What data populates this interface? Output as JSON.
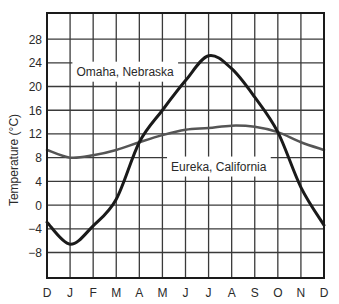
{
  "chart_data": {
    "type": "line",
    "title": "",
    "xlabel": "",
    "ylabel": "Temperature (°C)",
    "categories": [
      "D",
      "J",
      "F",
      "M",
      "A",
      "M",
      "J",
      "J",
      "A",
      "S",
      "O",
      "N",
      "D"
    ],
    "yticks": [
      -8,
      -4,
      0,
      4,
      8,
      12,
      16,
      20,
      24,
      28
    ],
    "ylim": [
      -12.3,
      32.4
    ],
    "grid": true,
    "legend": "inline labels",
    "series": [
      {
        "name": "Omaha, Nebraska",
        "color": "#1a1a1a",
        "stroke_width": 3,
        "values": [
          -2.9,
          -6.6,
          -3.5,
          1.0,
          10.6,
          16.0,
          21.0,
          25.2,
          23.0,
          18.2,
          12.3,
          3.0,
          -3.4
        ]
      },
      {
        "name": "Eureka, California",
        "color": "#555555",
        "stroke_width": 2.5,
        "values": [
          9.3,
          8.0,
          8.4,
          9.3,
          10.6,
          11.8,
          12.7,
          13.0,
          13.4,
          13.2,
          12.3,
          10.6,
          9.3
        ]
      }
    ],
    "annotations": [
      {
        "text": "Omaha, Nebraska",
        "x_index": 1.1,
        "y": 22.5
      },
      {
        "text": "Eureka, California",
        "x_index": 5.2,
        "y": 6.5
      }
    ]
  }
}
